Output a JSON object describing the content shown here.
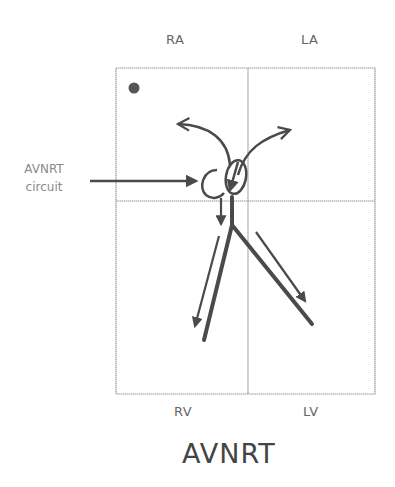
{
  "diagram": {
    "title": "AVNRT",
    "chambers": {
      "top_left": "RA",
      "top_right": "LA",
      "bottom_left": "RV",
      "bottom_right": "LV"
    },
    "callout": {
      "line1": "AVNRT",
      "line2": "circuit"
    },
    "markers": [
      "sinus-node-dot",
      "av-node-reentry-loop",
      "retrograde-atrial-arrows",
      "antegrade-ventricular-arrows"
    ],
    "colors": {
      "stroke": "#4a4a4a",
      "grid": "#9a9a9a",
      "text": "#666666"
    }
  }
}
